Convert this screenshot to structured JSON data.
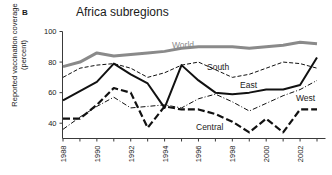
{
  "panel": {
    "label": "B"
  },
  "title": "Africa subregions",
  "axes": {
    "ylabel": "Reported vaccination coverage (percent)",
    "yticks": [
      40,
      60,
      80,
      100
    ],
    "xticks_labeled": [
      1988,
      1990,
      1992,
      1994,
      1996,
      1998,
      2000,
      2002
    ]
  },
  "series_labels": {
    "world": "World",
    "south": "South",
    "east": "East",
    "west": "West",
    "central": "Central"
  },
  "colors": {
    "world": "#8a8a8a",
    "east": "#111111",
    "south": "#111111",
    "west": "#111111",
    "central": "#111111",
    "axis": "#3a3a3a",
    "background": "#ffffff"
  },
  "chart_data": {
    "type": "line",
    "title": "Africa subregions",
    "xlabel": "",
    "ylabel": "Reported vaccination coverage (percent)",
    "xlim": [
      1988,
      2003
    ],
    "ylim": [
      30,
      100
    ],
    "grid": false,
    "legend": "inline-annotations",
    "x": [
      1988,
      1989,
      1990,
      1991,
      1992,
      1993,
      1994,
      1995,
      1996,
      1997,
      1998,
      1999,
      2000,
      2001,
      2002,
      2003
    ],
    "series": [
      {
        "name": "World",
        "style": "thick-solid-gray",
        "values": [
          77,
          80,
          86,
          84,
          85,
          86,
          87,
          89,
          90,
          90,
          90,
          89,
          90,
          91,
          93,
          92
        ]
      },
      {
        "name": "South",
        "style": "thin-dashed",
        "values": [
          70,
          76,
          78,
          79,
          76,
          70,
          73,
          78,
          80,
          75,
          70,
          72,
          76,
          80,
          79,
          76
        ]
      },
      {
        "name": "East",
        "style": "thick-solid-black",
        "values": [
          55,
          61,
          67,
          79,
          72,
          66,
          50,
          78,
          68,
          60,
          59,
          60,
          62,
          62,
          65,
          83
        ]
      },
      {
        "name": "West",
        "style": "thin-dash-dot",
        "values": [
          36,
          44,
          51,
          57,
          50,
          51,
          52,
          50,
          56,
          59,
          54,
          48,
          53,
          58,
          62,
          68
        ]
      },
      {
        "name": "Central",
        "style": "thick-long-dash",
        "values": [
          43,
          43,
          52,
          63,
          60,
          37,
          51,
          49,
          49,
          46,
          41,
          34,
          43,
          34,
          49,
          49
        ]
      }
    ]
  }
}
